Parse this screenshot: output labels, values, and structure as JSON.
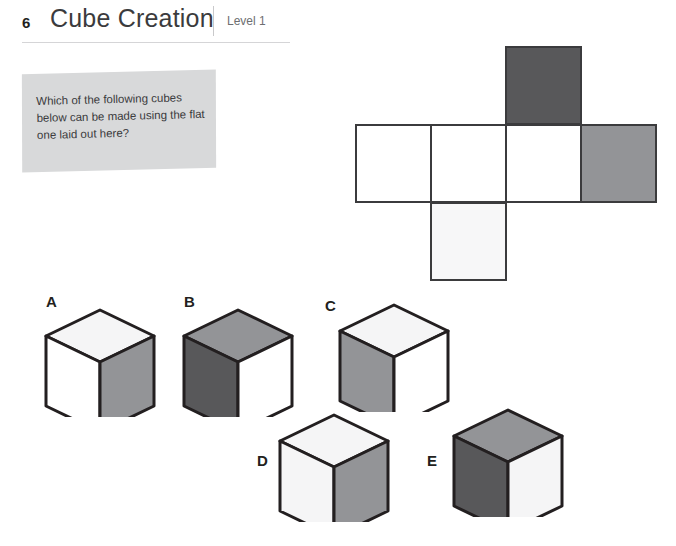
{
  "header": {
    "number": "6",
    "title": "Cube Creation",
    "level": "Level 1"
  },
  "question": {
    "text": "Which of the following cubes below can be made using the flat one laid out here?"
  },
  "colors": {
    "white": "#ffffff",
    "off_white": "#f5f5f6",
    "light_gray": "#f7f7f8",
    "medium_gray": "#939497",
    "dark_gray": "#58585a",
    "outline": "#231f20",
    "net_outline": "#3b3b3d",
    "callout_bg": "#d8d9da"
  },
  "net": {
    "description": "cube net: row of four squares with one square above the third and one below the second",
    "cell_size": 77,
    "cells": [
      {
        "name": "net-cell-row-1",
        "x": 0,
        "y": 84,
        "fill": "#ffffff"
      },
      {
        "name": "net-cell-row-2",
        "x": 75,
        "y": 84,
        "fill": "#ffffff"
      },
      {
        "name": "net-cell-row-3",
        "x": 150,
        "y": 84,
        "fill": "#ffffff"
      },
      {
        "name": "net-cell-row-4",
        "x": 225,
        "y": 84,
        "fill": "#939497"
      },
      {
        "name": "net-cell-top",
        "x": 150,
        "y": 6,
        "fill": "#58585a"
      },
      {
        "name": "net-cell-bottom",
        "x": 75,
        "y": 162,
        "fill": "#f7f7f8"
      }
    ]
  },
  "answers": [
    {
      "label": "A",
      "label_x": 46,
      "label_y": 293,
      "cube_x": 44,
      "cube_y": 308,
      "top": "#f5f5f6",
      "left": "#ffffff",
      "right": "#939497"
    },
    {
      "label": "B",
      "label_x": 184,
      "label_y": 293,
      "cube_x": 182,
      "cube_y": 308,
      "top": "#939497",
      "left": "#58585a",
      "right": "#ffffff"
    },
    {
      "label": "C",
      "label_x": 325,
      "label_y": 297,
      "cube_x": 338,
      "cube_y": 303,
      "top": "#f5f5f6",
      "left": "#939497",
      "right": "#ffffff"
    },
    {
      "label": "D",
      "label_x": 257,
      "label_y": 452,
      "cube_x": 278,
      "cube_y": 413,
      "top": "#f5f5f6",
      "left": "#f5f5f6",
      "right": "#939497"
    },
    {
      "label": "E",
      "label_x": 427,
      "label_y": 452,
      "cube_x": 452,
      "cube_y": 408,
      "top": "#939497",
      "left": "#58585a",
      "right": "#f5f5f6"
    }
  ]
}
